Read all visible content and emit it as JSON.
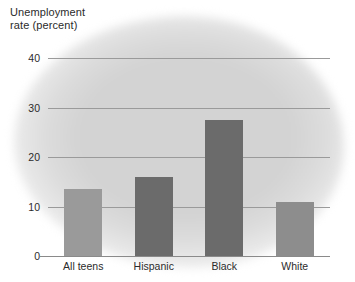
{
  "chart_data": {
    "type": "bar",
    "title": "Unemployment\nrate (percent)",
    "xlabel": "",
    "ylabel": "Unemployment rate (percent)",
    "categories": [
      "All teens",
      "Hispanic",
      "Black",
      "White"
    ],
    "values": [
      13.5,
      16.0,
      27.5,
      11.0
    ],
    "series": [
      {
        "name": "Unemployment rate",
        "values": [
          13.5,
          16.0,
          27.5,
          11.0
        ]
      }
    ],
    "ylim": [
      0,
      40
    ],
    "yticks": [
      0,
      10,
      20,
      30,
      40
    ],
    "ytick_labels": [
      "0",
      "10",
      "20",
      "30",
      "40"
    ],
    "grid": true,
    "legend": "none",
    "bar_colors": [
      "#9a9a9a",
      "#6b6b6b",
      "#6b6b6b",
      "#8d8d8d"
    ],
    "background_color": "#d3d3d3",
    "gridline_color": "#9a9a9a",
    "text_color": "#2b2b2b"
  }
}
